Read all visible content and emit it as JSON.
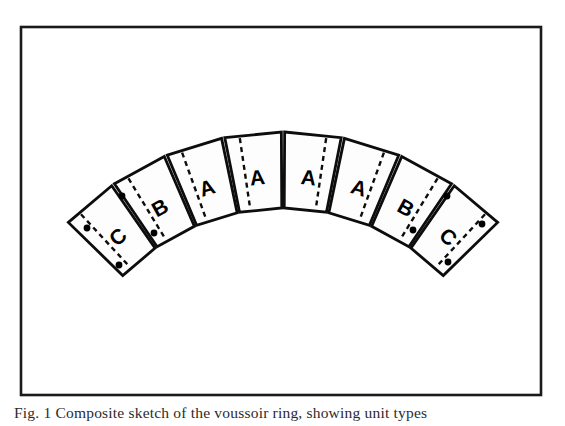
{
  "figure": {
    "frame": {
      "x": 21,
      "y": 27,
      "width": 520,
      "height": 368,
      "border_color": "#1a1a1a"
    },
    "canvas": {
      "width": 565,
      "height": 426
    },
    "background_color": "#ffffff",
    "ink_color": "#000000",
    "block_fill_color": "#fdfdfd"
  },
  "arch": {
    "type": "segmental-arch",
    "segment_count": 8,
    "center_x": 283,
    "center_y": 432,
    "outer_radius": 300,
    "inner_radius": 224,
    "span_start_angle_deg": -136,
    "span_end_angle_deg": -44,
    "apex_y": 132,
    "intrados_apex_y": 208,
    "left_tip": {
      "x": 70,
      "y": 228
    },
    "right_tip": {
      "x": 500,
      "y": 223
    },
    "labels": [
      "C",
      "B",
      "A",
      "A",
      "A",
      "A",
      "B",
      "C"
    ],
    "segments": [
      {
        "label": "C",
        "has_dashed_joint": true,
        "dot_count": 3
      },
      {
        "label": "B",
        "has_dashed_joint": true,
        "dot_count": 0
      },
      {
        "label": "A",
        "has_dashed_joint": true,
        "dot_count": 0
      },
      {
        "label": "A",
        "has_dashed_joint": true,
        "dot_count": 0
      },
      {
        "label": "A",
        "has_dashed_joint": true,
        "dot_count": 0
      },
      {
        "label": "A",
        "has_dashed_joint": true,
        "dot_count": 0
      },
      {
        "label": "B",
        "has_dashed_joint": true,
        "dot_count": 0
      },
      {
        "label": "C",
        "has_dashed_joint": true,
        "dot_count": 3
      }
    ],
    "anchor_dots": [
      {
        "x": 87,
        "y": 228
      },
      {
        "x": 122,
        "y": 196
      },
      {
        "x": 119,
        "y": 265
      },
      {
        "x": 154,
        "y": 233
      },
      {
        "x": 413,
        "y": 230
      },
      {
        "x": 447,
        "y": 196
      },
      {
        "x": 448,
        "y": 262
      },
      {
        "x": 482,
        "y": 224
      }
    ]
  },
  "caption": {
    "text": "Fig. 1  Composite sketch of the voussoir ring, showing unit types"
  }
}
